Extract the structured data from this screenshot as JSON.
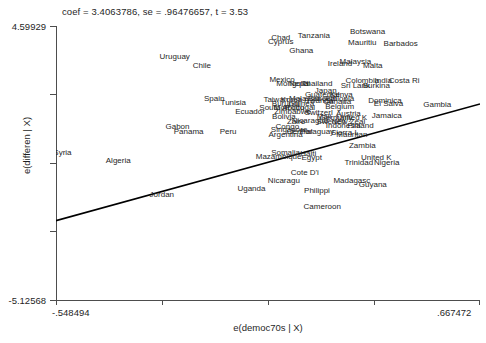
{
  "chart_data": {
    "type": "scatter",
    "title": "coef = 3.4063786, se = .96476657, t = 3.53",
    "xlabel": "e(democ70s | X)",
    "ylabel": "e(differen | X)",
    "xlim": [
      -0.548494,
      0.667472
    ],
    "ylim": [
      -5.12568,
      4.59929
    ],
    "xticks": [
      "-.548494",
      ".667472"
    ],
    "yticks": [
      "4.59929",
      "-5.12568"
    ],
    "grid": false,
    "legend": null,
    "fit_line": {
      "slope": 3.4063786,
      "se": 0.96476657,
      "t": 3.53,
      "x_start": -0.548494,
      "y_start": -2.31,
      "x_end": 0.667472,
      "y_end": 1.83
    },
    "marker_style": "text-labels",
    "points": [
      {
        "label": "Botswana",
        "x": 0.345,
        "y": 4.43
      },
      {
        "label": "Chad",
        "x": 0.096,
        "y": 4.2
      },
      {
        "label": "Cyprus",
        "x": 0.096,
        "y": 4.06
      },
      {
        "label": "Tanzania",
        "x": 0.191,
        "y": 4.27
      },
      {
        "label": "Mauritiu",
        "x": 0.33,
        "y": 4.02
      },
      {
        "label": "Barbados",
        "x": 0.44,
        "y": 3.99
      },
      {
        "label": "Ghana",
        "x": 0.155,
        "y": 3.73
      },
      {
        "label": "Uruguay",
        "x": -0.208,
        "y": 3.55
      },
      {
        "label": "Chile",
        "x": -0.13,
        "y": 3.22
      },
      {
        "label": "Ireland",
        "x": 0.266,
        "y": 3.28
      },
      {
        "label": "Malaysia",
        "x": 0.31,
        "y": 3.36
      },
      {
        "label": "Malta",
        "x": 0.36,
        "y": 3.22
      },
      {
        "label": "Mexico",
        "x": 0.1,
        "y": 2.72
      },
      {
        "label": "Mongolia",
        "x": 0.13,
        "y": 2.56
      },
      {
        "label": "Nepal",
        "x": 0.15,
        "y": 2.56
      },
      {
        "label": "Thailand",
        "x": 0.2,
        "y": 2.56
      },
      {
        "label": "Colombia",
        "x": 0.33,
        "y": 2.7
      },
      {
        "label": "India",
        "x": 0.39,
        "y": 2.68
      },
      {
        "label": "Costa Ri",
        "x": 0.45,
        "y": 2.68
      },
      {
        "label": "Sri Lank",
        "x": 0.31,
        "y": 2.52
      },
      {
        "label": "Burkina",
        "x": 0.37,
        "y": 2.5
      },
      {
        "label": "Japan",
        "x": 0.225,
        "y": 2.32
      },
      {
        "label": "Guatemal",
        "x": 0.215,
        "y": 2.2
      },
      {
        "label": "Kenya",
        "x": 0.27,
        "y": 2.18
      },
      {
        "label": "Ethiopia",
        "x": 0.265,
        "y": 2.06
      },
      {
        "label": "Senegal",
        "x": 0.215,
        "y": 2.06
      },
      {
        "label": "Spain",
        "x": -0.095,
        "y": 2.04
      },
      {
        "label": "Tunisia",
        "x": -0.04,
        "y": 1.9
      },
      {
        "label": "Taiwan",
        "x": 0.082,
        "y": 2.02
      },
      {
        "label": "Korea",
        "x": 0.127,
        "y": 2.02
      },
      {
        "label": "Malaysia2",
        "x": 0.165,
        "y": 2.06
      },
      {
        "label": "Rwanda",
        "x": 0.205,
        "y": 1.99
      },
      {
        "label": "Canada",
        "x": 0.258,
        "y": 1.93
      },
      {
        "label": "Burundi",
        "x": 0.11,
        "y": 1.88
      },
      {
        "label": "Guinea",
        "x": 0.155,
        "y": 1.88
      },
      {
        "label": "Dominica",
        "x": 0.395,
        "y": 1.98
      },
      {
        "label": "El Salva",
        "x": 0.405,
        "y": 1.86
      },
      {
        "label": "Gambia",
        "x": 0.545,
        "y": 1.82
      },
      {
        "label": "South Af",
        "x": 0.078,
        "y": 1.74
      },
      {
        "label": "Morocco",
        "x": 0.12,
        "y": 1.72
      },
      {
        "label": "Portugal",
        "x": 0.152,
        "y": 1.72
      },
      {
        "label": "Belgium",
        "x": 0.265,
        "y": 1.76
      },
      {
        "label": "Ecuador",
        "x": 0.008,
        "y": 1.6
      },
      {
        "label": "Zimbabwe",
        "x": 0.13,
        "y": 1.58
      },
      {
        "label": "Switzerl",
        "x": 0.205,
        "y": 1.55
      },
      {
        "label": "Austria",
        "x": 0.29,
        "y": 1.52
      },
      {
        "label": "Jamaica",
        "x": 0.4,
        "y": 1.44
      },
      {
        "label": "Bolivia",
        "x": 0.105,
        "y": 1.42
      },
      {
        "label": "Mali",
        "x": 0.22,
        "y": 1.4
      },
      {
        "label": "Germany",
        "x": 0.255,
        "y": 1.38
      },
      {
        "label": "United K",
        "x": 0.3,
        "y": 1.38
      },
      {
        "label": "Zaire",
        "x": 0.14,
        "y": 1.22
      },
      {
        "label": "Nicaragua",
        "x": 0.18,
        "y": 1.25
      },
      {
        "label": "Sweden",
        "x": 0.24,
        "y": 1.22
      },
      {
        "label": "New Zeal",
        "x": 0.29,
        "y": 1.22
      },
      {
        "label": "Indonesia",
        "x": 0.275,
        "y": 1.1
      },
      {
        "label": "Finland",
        "x": 0.325,
        "y": 1.1
      },
      {
        "label": "Gabon",
        "x": -0.2,
        "y": 1.05
      },
      {
        "label": "Congo",
        "x": 0.115,
        "y": 1.06
      },
      {
        "label": "Singapore",
        "x": 0.12,
        "y": 0.95
      },
      {
        "label": "Central",
        "x": 0.15,
        "y": 0.88
      },
      {
        "label": "Paraguay",
        "x": 0.2,
        "y": 0.86
      },
      {
        "label": "Sierra L",
        "x": 0.28,
        "y": 0.84
      },
      {
        "label": "Panama",
        "x": -0.168,
        "y": 0.88
      },
      {
        "label": "Peru",
        "x": -0.055,
        "y": 0.88
      },
      {
        "label": "Argentina",
        "x": 0.11,
        "y": 0.78
      },
      {
        "label": "Mauritan",
        "x": 0.3,
        "y": 0.76
      },
      {
        "label": "Zambia",
        "x": 0.33,
        "y": 0.38
      },
      {
        "label": "Syria",
        "x": -0.53,
        "y": 0.12
      },
      {
        "label": "Somalia",
        "x": 0.11,
        "y": 0.14
      },
      {
        "label": "Haiti",
        "x": 0.175,
        "y": 0.1
      },
      {
        "label": "Mazambique",
        "x": 0.09,
        "y": -0.02
      },
      {
        "label": "Egypt",
        "x": 0.185,
        "y": -0.06
      },
      {
        "label": "Algeria",
        "x": -0.37,
        "y": -0.14
      },
      {
        "label": "United K2",
        "x": 0.37,
        "y": -0.04
      },
      {
        "label": "Trinidad",
        "x": 0.32,
        "y": -0.22
      },
      {
        "label": "Nigeria",
        "x": 0.4,
        "y": -0.22
      },
      {
        "label": "Cote D'i",
        "x": 0.165,
        "y": -0.58
      },
      {
        "label": "Nicaragu",
        "x": 0.105,
        "y": -0.88
      },
      {
        "label": "Madagasc",
        "x": 0.3,
        "y": -0.88
      },
      {
        "label": "Guyana",
        "x": 0.36,
        "y": -1.02
      },
      {
        "label": "Uganda",
        "x": 0.012,
        "y": -1.16
      },
      {
        "label": "Philippi",
        "x": 0.2,
        "y": -1.22
      },
      {
        "label": "Jordan",
        "x": -0.245,
        "y": -1.38
      },
      {
        "label": "Cameroon",
        "x": 0.215,
        "y": -1.78
      }
    ]
  },
  "axes": {
    "y_title": "e(differen | X)",
    "x_title": "e(democ70s | X)",
    "y_tick_top": "4.59929",
    "y_tick_bottom": "-5.12568",
    "x_tick_left": "-.548494",
    "x_tick_right": ".667472"
  },
  "annotation": {
    "coef_text": "coef = 3.4063786, se = .96476657, t = 3.53"
  },
  "colors": {
    "axis": "#4d4d4d",
    "text": "#262626",
    "fit_line": "#000000",
    "background": "#ffffff"
  }
}
